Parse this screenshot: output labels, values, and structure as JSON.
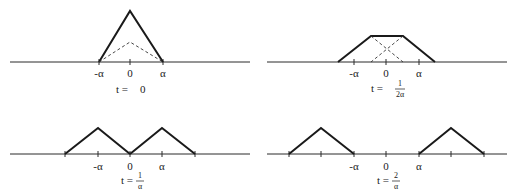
{
  "diagram": {
    "panels": [
      {
        "id": "t0",
        "tick_labels": [
          "-α",
          "0",
          "α"
        ],
        "time_label_prefix": "t = ",
        "time_label_value": "0",
        "time_num": "",
        "time_den": ""
      },
      {
        "id": "t_half",
        "tick_labels": [
          "-α",
          "0",
          "α"
        ],
        "time_label_prefix": "t = ",
        "time_label_value": "",
        "time_num": "1",
        "time_den": "2α"
      },
      {
        "id": "t_one",
        "tick_labels": [
          "-α",
          "0",
          "α"
        ],
        "time_label_prefix": "t = ",
        "time_label_value": "",
        "time_num": "1",
        "time_den": "α"
      },
      {
        "id": "t_two",
        "tick_labels": [
          "-α",
          "0",
          "α"
        ],
        "time_label_prefix": "t = ",
        "time_label_value": "",
        "time_num": "2",
        "time_den": "α"
      }
    ],
    "colors": {
      "line": "#1a1a1a",
      "background": "#ffffff"
    }
  }
}
